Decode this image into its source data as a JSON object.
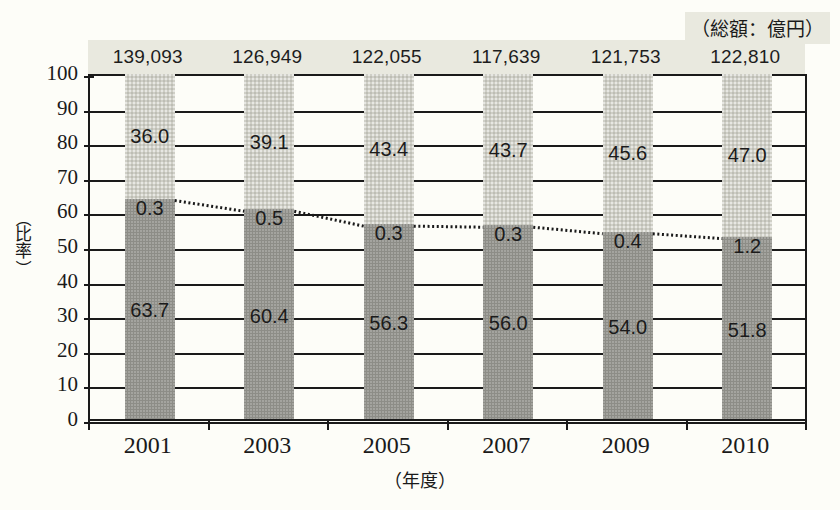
{
  "chart_data": {
    "type": "bar",
    "title": "",
    "subtitle": "",
    "xlabel": "（年度）",
    "ylabel": "（比率）",
    "ylim": [
      0,
      100
    ],
    "yticks": [
      0,
      10,
      20,
      30,
      40,
      50,
      60,
      70,
      80,
      90,
      100
    ],
    "grid": true,
    "legend_position": "none",
    "categories": [
      "2001",
      "2003",
      "2005",
      "2007",
      "2009",
      "2010"
    ],
    "stacked": true,
    "series": [
      {
        "name": "下段",
        "values": [
          63.7,
          60.4,
          56.3,
          56.0,
          54.0,
          51.8
        ]
      },
      {
        "name": "中段",
        "values": [
          0.3,
          0.5,
          0.3,
          0.3,
          0.4,
          1.2
        ]
      },
      {
        "name": "上段",
        "values": [
          36.0,
          39.1,
          43.4,
          43.7,
          45.6,
          47.0
        ]
      }
    ],
    "totals_row": {
      "unit_label": "（総額：億円）",
      "values": [
        "139,093",
        "126,949",
        "122,055",
        "117,639",
        "121,753",
        "122,810"
      ]
    },
    "annotations": {
      "connector_line": "dotted line joining the top of the lower (dark) segment across years"
    }
  },
  "colors": {
    "segment_top": "#cfcfc6",
    "segment_mid": "#8d8d87",
    "segment_bottom": "#8d8d87",
    "axis": "#1a1a1a",
    "header_band": "#e9e9df",
    "background": "#fdfdf8"
  }
}
